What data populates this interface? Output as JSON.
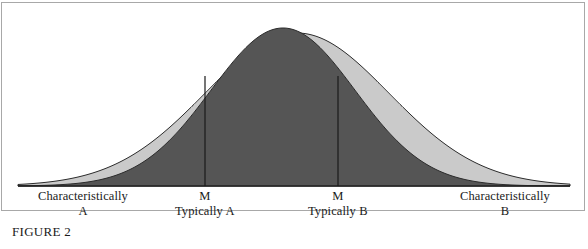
{
  "figure": {
    "caption": "FIGURE 2",
    "colors": {
      "curve_a_fill": "#555555",
      "curve_b_fill": "#cacaca",
      "outline": "#2b2b2b",
      "axis": "#1a1a1a",
      "marker_line": "#1a1a1a",
      "frame": "#a8a8a8",
      "background": "#ffffff"
    },
    "labels": [
      {
        "name": "left-extreme",
        "line1": "Characteristically",
        "line2": "A",
        "x": 83
      },
      {
        "name": "marker-a",
        "line1": "M",
        "line2": "Typically A",
        "x": 205
      },
      {
        "name": "marker-b",
        "line1": "M",
        "line2": "Typically B",
        "x": 338
      },
      {
        "name": "right-extreme",
        "line1": "Characteristically",
        "line2": "B",
        "x": 505
      }
    ]
  },
  "chart_data": {
    "type": "area",
    "title": "",
    "subtitle": "",
    "xlabel": "",
    "ylabel": "",
    "grid": false,
    "legend": "none",
    "axis": {
      "baseline_y": 186,
      "x_start": 18,
      "x_end": 570,
      "tick_labels": [
        "Characteristically A",
        "M Typically A",
        "M Typically B",
        "Characteristically B"
      ]
    },
    "series": [
      {
        "name": "Distribution A",
        "fill": "#555555",
        "peak_x": 283,
        "peak_y": 28,
        "sigma": 72,
        "amplitude": 158,
        "description": "Narrower dark-filled normal curve, peak slightly left of center"
      },
      {
        "name": "Distribution B",
        "fill": "#cacaca",
        "peak_x": 297,
        "peak_y": 33,
        "sigma": 92,
        "amplitude": 153,
        "description": "Wider light-filled normal curve, peak slightly right of center"
      }
    ],
    "markers": [
      {
        "name": "M Typically A",
        "x": 205,
        "top_y": 76,
        "bottom_y": 186
      },
      {
        "name": "M Typically B",
        "x": 338,
        "top_y": 76,
        "bottom_y": 186
      }
    ]
  }
}
